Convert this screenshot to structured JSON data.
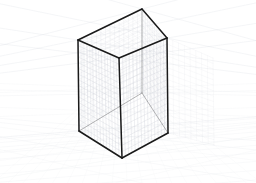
{
  "scene": {
    "title": "Two-point perspective cuboid construction drawing",
    "width": 256,
    "height": 183,
    "background_color": "#ffffff",
    "horizon_y": 100
  },
  "colors": {
    "background": "#ffffff",
    "box_edge": "#1a1a1a",
    "box_edge_hidden": "#4d4d4d",
    "grid_fine": "#c8ccd4",
    "grid_faint": "#dfe3e9",
    "ground_grid": "#e4e7ec",
    "vanishing_guide": "#d5d9e0",
    "vanishing_guide_faint": "#e8eaee"
  },
  "vanishing_points": {
    "left": {
      "label": "VP-left",
      "x": -210,
      "y": 100
    },
    "right": {
      "label": "VP-right",
      "x": 470,
      "y": 100
    }
  },
  "box": {
    "label": "cuboid",
    "vertices": {
      "top_back": {
        "label": "top-back",
        "x": 142,
        "y": 9
      },
      "top_left": {
        "label": "top-left",
        "x": 78,
        "y": 40
      },
      "top_right": {
        "label": "top-right",
        "x": 167,
        "y": 38
      },
      "top_front": {
        "label": "top-front",
        "x": 119,
        "y": 58
      },
      "bot_back": {
        "label": "bottom-back",
        "x": 142,
        "y": 93
      },
      "bot_left": {
        "label": "bottom-left",
        "x": 79,
        "y": 131
      },
      "bot_right": {
        "label": "bottom-right",
        "x": 168,
        "y": 133
      },
      "bot_front": {
        "label": "bottom-front",
        "x": 122,
        "y": 158
      }
    },
    "edges": [
      {
        "label": "top-edge-back-left",
        "from": "top_back",
        "to": "top_left",
        "visible": true
      },
      {
        "label": "top-edge-back-right",
        "from": "top_back",
        "to": "top_right",
        "visible": true
      },
      {
        "label": "top-edge-front-left",
        "from": "top_left",
        "to": "top_front",
        "visible": true
      },
      {
        "label": "top-edge-front-right",
        "from": "top_front",
        "to": "top_right",
        "visible": true
      },
      {
        "label": "vertical-left",
        "from": "top_left",
        "to": "bot_left",
        "visible": true
      },
      {
        "label": "vertical-front",
        "from": "top_front",
        "to": "bot_front",
        "visible": true
      },
      {
        "label": "vertical-right",
        "from": "top_right",
        "to": "bot_right",
        "visible": true
      },
      {
        "label": "vertical-back-hidden",
        "from": "top_back",
        "to": "bot_back",
        "visible": false
      },
      {
        "label": "bottom-edge-front-left",
        "from": "bot_left",
        "to": "bot_front",
        "visible": true
      },
      {
        "label": "bottom-edge-front-right",
        "from": "bot_front",
        "to": "bot_right",
        "visible": true
      },
      {
        "label": "bottom-edge-back-left",
        "from": "bot_left",
        "to": "bot_back",
        "visible": false
      },
      {
        "label": "bottom-edge-back-right",
        "from": "bot_back",
        "to": "bot_right",
        "visible": false
      }
    ],
    "face_grid_divisions_u": 14,
    "face_grid_divisions_v": 16
  },
  "guides": {
    "left_rays_count": 9,
    "right_rays_count": 9,
    "ground_grid_rows": 12,
    "description": "Faint converging construction rays from both vanishing points plus a receding ground-plane grid"
  }
}
